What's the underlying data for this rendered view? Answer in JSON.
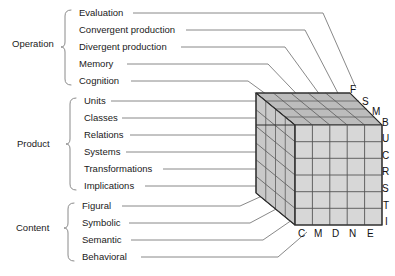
{
  "diagram": {
    "groups": [
      {
        "name": "Operation",
        "label": "Operation",
        "label_x": 12,
        "label_y": 44,
        "items": [
          {
            "label": "Evaluation",
            "code": "E",
            "y": 16
          },
          {
            "label": "Convergent production",
            "code": "N",
            "y": 33
          },
          {
            "label": "Divergent production",
            "code": "D",
            "y": 50
          },
          {
            "label": "Memory",
            "code": "M",
            "y": 67
          },
          {
            "label": "Cognition",
            "code": "C",
            "y": 84
          }
        ]
      },
      {
        "name": "Product",
        "label": "Product",
        "label_x": 17,
        "label_y": 144,
        "items": [
          {
            "label": "Units",
            "code": "U",
            "y": 104
          },
          {
            "label": "Classes",
            "code": "C",
            "y": 121
          },
          {
            "label": "Relations",
            "code": "R",
            "y": 138
          },
          {
            "label": "Systems",
            "code": "S",
            "y": 155
          },
          {
            "label": "Transformations",
            "code": "T",
            "y": 172
          },
          {
            "label": "Implications",
            "code": "I",
            "y": 189
          }
        ]
      },
      {
        "name": "Content",
        "label": "Content",
        "label_x": 16,
        "label_y": 228,
        "items": [
          {
            "label": "Figural",
            "code": "F",
            "y": 209
          },
          {
            "label": "Symbolic",
            "code": "S",
            "y": 226
          },
          {
            "label": "Semantic",
            "code": "M",
            "y": 243
          },
          {
            "label": "Behavioral",
            "code": "B",
            "y": 260
          }
        ]
      }
    ],
    "cube": {
      "columns": 5,
      "rows": 6,
      "depth": 4,
      "bottom_axis_codes": [
        "C",
        "M",
        "D",
        "N",
        "E"
      ],
      "top_axis_codes": [
        "F",
        "S",
        "M",
        "B"
      ],
      "right_axis_codes": [
        "U",
        "C",
        "R",
        "S",
        "T",
        "I"
      ],
      "front_fill": "#d6d6d6",
      "top_fill": "#bdbdbd",
      "side_fill": "#c8c8c8",
      "line_color": "#555555",
      "edge_color": "#333333"
    },
    "connector_color": "#777777"
  }
}
